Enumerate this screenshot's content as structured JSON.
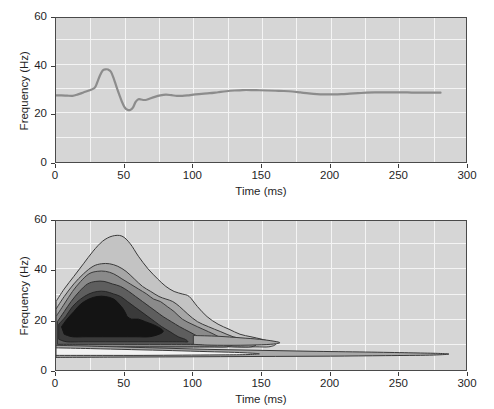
{
  "figure": {
    "background": "#ffffff",
    "panel_background": "#d6d6d6",
    "gridline_color": "#f4f4f4",
    "frame_color": "#4a4a4a"
  },
  "chart_data": [
    {
      "type": "line",
      "panel": "top",
      "title": "",
      "xlabel": "Time (ms)",
      "ylabel": "Frequency (Hz)",
      "xlim": [
        0,
        300
      ],
      "ylim": [
        0,
        60
      ],
      "xticks": [
        0,
        50,
        100,
        150,
        200,
        250,
        300
      ],
      "xticklabels": [
        "0",
        "50",
        "100",
        "150",
        "200",
        "250",
        "300"
      ],
      "yticks": [
        0,
        20,
        40,
        60
      ],
      "yticklabels": [
        "0",
        "20",
        "40",
        "60"
      ],
      "grid": true,
      "grid_x": [
        25,
        50,
        75,
        100,
        125,
        150,
        175,
        200,
        225,
        250,
        275
      ],
      "grid_y": [
        10,
        20,
        30,
        40,
        50
      ],
      "legend": "none",
      "line_color": "#8c8c8c",
      "line_width": 2.2,
      "series": [
        {
          "name": "instantaneous frequency",
          "x": [
            0,
            4,
            8,
            12,
            16,
            20,
            24,
            28,
            30,
            32,
            34,
            36,
            38,
            40,
            42,
            44,
            46,
            48,
            50,
            52,
            54,
            56,
            58,
            60,
            62,
            64,
            66,
            68,
            72,
            76,
            80,
            84,
            88,
            92,
            96,
            100,
            106,
            112,
            118,
            124,
            130,
            136,
            142,
            148,
            154,
            160,
            166,
            172,
            178,
            184,
            190,
            196,
            202,
            208,
            214,
            220,
            226,
            232,
            238,
            244,
            250,
            256,
            262,
            268,
            274,
            280
          ],
          "y": [
            28.2,
            28.2,
            28.1,
            28.0,
            28.6,
            29.4,
            30.2,
            31.2,
            33.5,
            36.4,
            38.4,
            38.9,
            38.8,
            37.9,
            35.2,
            31.8,
            28.6,
            25.6,
            23.3,
            22.3,
            22.2,
            23.2,
            25.5,
            26.6,
            26.5,
            26.3,
            26.4,
            26.8,
            27.6,
            28.2,
            28.5,
            28.3,
            28.0,
            28.0,
            28.2,
            28.5,
            28.8,
            29.1,
            29.5,
            29.9,
            30.2,
            30.4,
            30.4,
            30.3,
            30.2,
            30.1,
            30.0,
            29.8,
            29.4,
            29.0,
            28.7,
            28.6,
            28.6,
            28.7,
            28.9,
            29.1,
            29.3,
            29.4,
            29.4,
            29.4,
            29.4,
            29.4,
            29.3,
            29.3,
            29.3,
            29.3
          ]
        }
      ]
    },
    {
      "type": "contour",
      "panel": "bottom",
      "title": "",
      "xlabel": "Time (ms)",
      "ylabel": "Frequency (Hz)",
      "xlim": [
        0,
        300
      ],
      "ylim": [
        0,
        60
      ],
      "xticks": [
        0,
        50,
        100,
        150,
        200,
        250,
        300
      ],
      "xticklabels": [
        "0",
        "50",
        "100",
        "150",
        "200",
        "250",
        "300"
      ],
      "yticks": [
        0,
        20,
        40,
        60
      ],
      "yticklabels": [
        "0",
        "20",
        "40",
        "60"
      ],
      "grid": true,
      "grid_x": [
        25,
        50,
        75,
        100,
        125,
        150,
        175,
        200,
        225,
        250,
        275
      ],
      "grid_y": [
        10,
        20,
        30,
        40,
        50
      ],
      "legend": "none",
      "filled": true,
      "description": "Time-frequency energy distribution: broad lobe peaking near 40-50 ms centred around 20-28 Hz, plus a narrow low-frequency ridge near 5-10 Hz extending to about 285 ms.",
      "levels": [
        {
          "name": "level-1-outer",
          "fill": "#c3c3c3",
          "stroke": "#3a3a3a"
        },
        {
          "name": "level-2",
          "fill": "#a6a6a6",
          "stroke": "#3a3a3a"
        },
        {
          "name": "level-3",
          "fill": "#8a8a8a",
          "stroke": "#3a3a3a"
        },
        {
          "name": "level-4",
          "fill": "#5e5e5e",
          "stroke": "#2e2e2e"
        },
        {
          "name": "level-5",
          "fill": "#3a3a3a",
          "stroke": "#252525"
        },
        {
          "name": "level-6-core",
          "fill": "#141414",
          "stroke": "#141414"
        }
      ],
      "low_band": [
        {
          "name": "low-ridge-outer",
          "fill": "#a8a8a8",
          "stroke": "#3a3a3a"
        },
        {
          "name": "low-ridge-inner",
          "fill": "#f2f2f2",
          "stroke": "#3a3a3a"
        }
      ]
    }
  ]
}
